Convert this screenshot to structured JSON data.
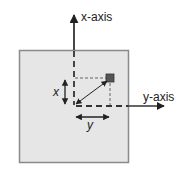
{
  "diagram": {
    "labels": {
      "x_axis": "x-axis",
      "y_axis": "y-axis",
      "x_distance": "x",
      "y_distance": "y"
    },
    "colors": {
      "panel_fill": "#e6e6e6",
      "panel_border": "#8a8a8a",
      "axis": "#333333",
      "guide": "#555555",
      "point": "#555555"
    },
    "elements": {
      "panel": "square-panel",
      "point": "square-marker",
      "vector": "double-headed-diagonal-arrow",
      "x_measure": "vertical-double-arrow",
      "y_measure": "horizontal-double-arrow"
    }
  }
}
